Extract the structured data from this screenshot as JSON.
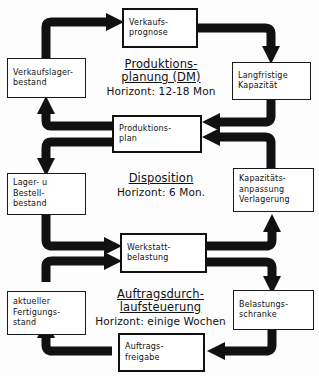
{
  "diagram": {
    "language": "de",
    "ink_color": "#111111",
    "background_color": "#ffffff",
    "phases": [
      {
        "id": "produktionsplanung",
        "line1": "Produktions-",
        "line2": "planung (DM)",
        "horizon": "Horizont: 12-18 Mon"
      },
      {
        "id": "disposition",
        "line1": "Disposition",
        "line2": "",
        "horizon": "Horizont: 6 Mon."
      },
      {
        "id": "auftragsdurchlaufsteuerung",
        "line1": "Auftragsdurch-",
        "line2": "laufsteuerung",
        "horizon": "Horizont: einige Wochen"
      }
    ],
    "boxes": [
      {
        "id": "verkaufsprognose",
        "lines": [
          "Verkaufs-",
          "prognose"
        ],
        "weight": "thick"
      },
      {
        "id": "verkaufslagerbestand",
        "lines": [
          "Verkaufslager-",
          "bestand"
        ],
        "weight": "thin"
      },
      {
        "id": "langfristige-kapazitaet",
        "lines": [
          "Langfristige",
          "Kapazität"
        ],
        "weight": "thin"
      },
      {
        "id": "produktionsplan",
        "lines": [
          "Produktions-",
          "plan"
        ],
        "weight": "thick"
      },
      {
        "id": "lager-bestellbestand",
        "lines": [
          "Lager- u",
          "Bestell-",
          "bestand"
        ],
        "weight": "thin"
      },
      {
        "id": "kapazitaetsanpassung",
        "lines": [
          "Kapazitäts-",
          "anpassung",
          "Verlagerung"
        ],
        "weight": "thin"
      },
      {
        "id": "werkstattbelastung",
        "lines": [
          "Werkstatt-",
          "belastung"
        ],
        "weight": "thick"
      },
      {
        "id": "aktueller-fertigungsstand",
        "lines": [
          "aktueller",
          "Fertigungs-",
          "stand"
        ],
        "weight": "thin"
      },
      {
        "id": "belastungsschranke",
        "lines": [
          "Belastungs-",
          "schranke"
        ],
        "weight": "thin"
      },
      {
        "id": "auftragsfreigabe",
        "lines": [
          "Auftrags-",
          "freigabe"
        ],
        "weight": "thick"
      }
    ],
    "flows": [
      {
        "from": "verkaufslagerbestand",
        "to": "verkaufsprognose"
      },
      {
        "from": "verkaufsprognose",
        "to": "langfristige-kapazitaet"
      },
      {
        "from": "langfristige-kapazitaet",
        "to": "produktionsplan"
      },
      {
        "from": "produktionsplan",
        "to": "verkaufslagerbestand"
      },
      {
        "from": "produktionsplan",
        "to": "lager-bestellbestand"
      },
      {
        "from": "lager-bestellbestand",
        "to": "werkstattbelastung"
      },
      {
        "from": "werkstattbelastung",
        "to": "kapazitaetsanpassung"
      },
      {
        "from": "kapazitaetsanpassung",
        "to": "produktionsplan"
      },
      {
        "from": "werkstattbelastung",
        "to": "belastungsschranke"
      },
      {
        "from": "belastungsschranke",
        "to": "auftragsfreigabe"
      },
      {
        "from": "auftragsfreigabe",
        "to": "aktueller-fertigungsstand"
      },
      {
        "from": "aktueller-fertigungsstand",
        "to": "werkstattbelastung"
      }
    ]
  }
}
